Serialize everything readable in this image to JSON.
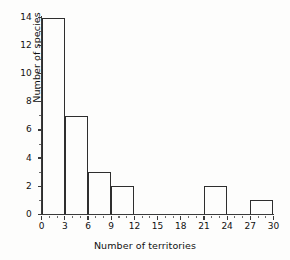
{
  "figure": {
    "background_color": "#fdfdfc",
    "line_color": "#2e2e2e"
  },
  "chart_data": {
    "type": "bar",
    "title": "",
    "subtitle": "",
    "xlabel": "Number of territories",
    "ylabel": "Number of species",
    "xlim": [
      0,
      30
    ],
    "ylim": [
      0,
      14
    ],
    "grid": false,
    "legend": null,
    "bin_width": 3,
    "bin_edges": [
      0,
      3,
      6,
      9,
      12,
      15,
      18,
      21,
      24,
      27,
      30
    ],
    "categories": [
      "0-3",
      "3-6",
      "6-9",
      "9-12",
      "12-15",
      "15-18",
      "18-21",
      "21-24",
      "24-27",
      "27-30"
    ],
    "values": [
      14,
      7,
      3,
      2,
      0,
      0,
      0,
      2,
      0,
      1
    ],
    "bars": [
      {
        "label": "0-3",
        "start": 0,
        "end": 3,
        "value": 14
      },
      {
        "label": "3-6",
        "start": 3,
        "end": 6,
        "value": 7
      },
      {
        "label": "6-9",
        "start": 6,
        "end": 9,
        "value": 3
      },
      {
        "label": "9-12",
        "start": 9,
        "end": 12,
        "value": 2
      },
      {
        "label": "12-15",
        "start": 12,
        "end": 15,
        "value": 0
      },
      {
        "label": "15-18",
        "start": 15,
        "end": 18,
        "value": 0
      },
      {
        "label": "18-21",
        "start": 18,
        "end": 21,
        "value": 0
      },
      {
        "label": "21-24",
        "start": 21,
        "end": 24,
        "value": 2
      },
      {
        "label": "24-27",
        "start": 24,
        "end": 27,
        "value": 0
      },
      {
        "label": "27-30",
        "start": 27,
        "end": 30,
        "value": 1
      }
    ],
    "x_tick_labels": [
      "0",
      "3",
      "6",
      "9",
      "12",
      "15",
      "18",
      "21",
      "24",
      "27",
      "30"
    ],
    "x_tick_values": [
      0,
      3,
      6,
      9,
      12,
      15,
      18,
      21,
      24,
      27,
      30
    ],
    "x_minor_tick_values": [
      1,
      2,
      4,
      5,
      7,
      8,
      10,
      11,
      13,
      14,
      16,
      17,
      19,
      20,
      22,
      23,
      25,
      26,
      28,
      29
    ],
    "y_tick_labels": [
      "0",
      "2",
      "4",
      "6",
      "8",
      "10",
      "12",
      "14"
    ],
    "y_tick_values": [
      0,
      2,
      4,
      6,
      8,
      10,
      12,
      14
    ],
    "y_minor_tick_values": [
      1,
      3,
      5,
      7,
      9,
      11,
      13
    ]
  }
}
